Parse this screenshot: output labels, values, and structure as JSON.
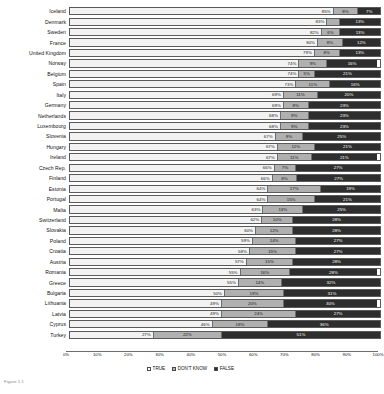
{
  "chart_data": {
    "type": "bar",
    "subtype": "horizontal-100-percent-stacked",
    "title": "",
    "xlabel": "",
    "ylabel": "",
    "xlim": [
      0,
      100
    ],
    "grid": false,
    "legend_position": "bottom-center",
    "legend": [
      "TRUE",
      "DON'T KNOW",
      "FALSE"
    ],
    "tick_labels": [
      "0%",
      "10%",
      "20%",
      "30%",
      "40%",
      "50%",
      "60%",
      "70%",
      "80%",
      "90%",
      "100%"
    ],
    "tick_values": [
      0,
      10,
      20,
      30,
      40,
      50,
      60,
      70,
      80,
      90,
      100
    ],
    "categories": [
      "Iceland",
      "Denmark",
      "Sweden",
      "France",
      "United Kingdom",
      "Norway",
      "Belgium",
      "Spain",
      "Italy",
      "Germany",
      "Netherlands",
      "Luxembourg",
      "Slovenia",
      "Hungary",
      "Ireland",
      "Czech Rep.",
      "Finland",
      "Estonia",
      "Portugal",
      "Malta",
      "Switzerland",
      "Slovakia",
      "Poland",
      "Croatia",
      "Austria",
      "Romania",
      "Greece",
      "Bulgaria",
      "Lithuania",
      "Latvia",
      "Cyprus",
      "Turkey"
    ],
    "series": [
      {
        "name": "TRUE",
        "color": "#f2f2f2",
        "values": [
          85,
          83,
          82,
          80,
          79,
          74,
          74,
          73,
          69,
          69,
          68,
          68,
          67,
          67,
          67,
          66,
          66,
          64,
          64,
          63,
          62,
          60,
          59,
          58,
          57,
          55,
          55,
          50,
          49,
          49,
          46,
          27
        ]
      },
      {
        "name": "DON'T KNOW",
        "color": "#b0b0b0",
        "values": [
          8,
          4,
          6,
          8,
          8,
          9,
          5,
          11,
          11,
          8,
          9,
          9,
          9,
          12,
          11,
          7,
          8,
          17,
          15,
          13,
          10,
          12,
          14,
          15,
          15,
          16,
          14,
          19,
          20,
          24,
          18,
          22
        ]
      },
      {
        "name": "FALSE",
        "color": "#2e2e2e",
        "values": [
          7,
          13,
          13,
          12,
          13,
          16,
          21,
          16,
          20,
          23,
          23,
          23,
          25,
          21,
          21,
          27,
          27,
          19,
          21,
          25,
          28,
          28,
          27,
          27,
          28,
          28,
          32,
          31,
          30,
          27,
          36,
          51
        ]
      }
    ],
    "rows": [
      {
        "category": "Iceland",
        "true": 85,
        "dont_know": 8,
        "false": 7,
        "true_label": "85%",
        "dont_know_label": "8%",
        "false_label": "7%"
      },
      {
        "category": "Denmark",
        "true": 83,
        "dont_know": 4,
        "false": 13,
        "true_label": "83%",
        "dont_know_label": "4%",
        "false_label": "13%"
      },
      {
        "category": "Sweden",
        "true": 82,
        "dont_know": 6,
        "false": 13,
        "true_label": "82%",
        "dont_know_label": "6%",
        "false_label": "13%"
      },
      {
        "category": "France",
        "true": 80,
        "dont_know": 8,
        "false": 12,
        "true_label": "80%",
        "dont_know_label": "8%",
        "false_label": "12%"
      },
      {
        "category": "United Kingdom",
        "true": 79,
        "dont_know": 8,
        "false": 13,
        "true_label": "79%",
        "dont_know_label": "8%",
        "false_label": "13%"
      },
      {
        "category": "Norway",
        "true": 74,
        "dont_know": 9,
        "false": 16,
        "true_label": "74%",
        "dont_know_label": "9%",
        "false_label": "16%"
      },
      {
        "category": "Belgium",
        "true": 74,
        "dont_know": 5,
        "false": 21,
        "true_label": "74%",
        "dont_know_label": "5%",
        "false_label": "21%"
      },
      {
        "category": "Spain",
        "true": 73,
        "dont_know": 11,
        "false": 16,
        "true_label": "73%",
        "dont_know_label": "11%",
        "false_label": "16%"
      },
      {
        "category": "Italy",
        "true": 69,
        "dont_know": 11,
        "false": 20,
        "true_label": "69%",
        "dont_know_label": "11%",
        "false_label": "20%"
      },
      {
        "category": "Germany",
        "true": 69,
        "dont_know": 8,
        "false": 23,
        "true_label": "69%",
        "dont_know_label": "8%",
        "false_label": "23%"
      },
      {
        "category": "Netherlands",
        "true": 68,
        "dont_know": 9,
        "false": 23,
        "true_label": "68%",
        "dont_know_label": "9%",
        "false_label": "23%"
      },
      {
        "category": "Luxembourg",
        "true": 68,
        "dont_know": 9,
        "false": 23,
        "true_label": "68%",
        "dont_know_label": "9%",
        "false_label": "23%"
      },
      {
        "category": "Slovenia",
        "true": 67,
        "dont_know": 9,
        "false": 25,
        "true_label": "67%",
        "dont_know_label": "9%",
        "false_label": "25%"
      },
      {
        "category": "Hungary",
        "true": 67,
        "dont_know": 12,
        "false": 21,
        "true_label": "67%",
        "dont_know_label": "12%",
        "false_label": "21%"
      },
      {
        "category": "Ireland",
        "true": 67,
        "dont_know": 11,
        "false": 21,
        "true_label": "67%",
        "dont_know_label": "11%",
        "false_label": "21%"
      },
      {
        "category": "Czech Rep.",
        "true": 66,
        "dont_know": 7,
        "false": 27,
        "true_label": "66%",
        "dont_know_label": "7%",
        "false_label": "27%"
      },
      {
        "category": "Finland",
        "true": 66,
        "dont_know": 8,
        "false": 27,
        "true_label": "66%",
        "dont_know_label": "8%",
        "false_label": "27%"
      },
      {
        "category": "Estonia",
        "true": 64,
        "dont_know": 17,
        "false": 19,
        "true_label": "64%",
        "dont_know_label": "17%",
        "false_label": "19%"
      },
      {
        "category": "Portugal",
        "true": 64,
        "dont_know": 15,
        "false": 21,
        "true_label": "64%",
        "dont_know_label": "15%",
        "false_label": "21%"
      },
      {
        "category": "Malta",
        "true": 63,
        "dont_know": 13,
        "false": 25,
        "true_label": "63%",
        "dont_know_label": "13%",
        "false_label": "25%"
      },
      {
        "category": "Switzerland",
        "true": 62,
        "dont_know": 10,
        "false": 28,
        "true_label": "62%",
        "dont_know_label": "10%",
        "false_label": "28%"
      },
      {
        "category": "Slovakia",
        "true": 60,
        "dont_know": 12,
        "false": 28,
        "true_label": "60%",
        "dont_know_label": "12%",
        "false_label": "28%"
      },
      {
        "category": "Poland",
        "true": 59,
        "dont_know": 14,
        "false": 27,
        "true_label": "59%",
        "dont_know_label": "14%",
        "false_label": "27%"
      },
      {
        "category": "Croatia",
        "true": 58,
        "dont_know": 15,
        "false": 27,
        "true_label": "58%",
        "dont_know_label": "15%",
        "false_label": "27%"
      },
      {
        "category": "Austria",
        "true": 57,
        "dont_know": 15,
        "false": 28,
        "true_label": "57%",
        "dont_know_label": "15%",
        "false_label": "28%"
      },
      {
        "category": "Romania",
        "true": 55,
        "dont_know": 16,
        "false": 28,
        "true_label": "55%",
        "dont_know_label": "16%",
        "false_label": "28%"
      },
      {
        "category": "Greece",
        "true": 55,
        "dont_know": 14,
        "false": 32,
        "true_label": "55%",
        "dont_know_label": "14%",
        "false_label": "32%"
      },
      {
        "category": "Bulgaria",
        "true": 50,
        "dont_know": 19,
        "false": 31,
        "true_label": "50%",
        "dont_know_label": "19%",
        "false_label": "31%"
      },
      {
        "category": "Lithuania",
        "true": 49,
        "dont_know": 20,
        "false": 30,
        "true_label": "49%",
        "dont_know_label": "20%",
        "false_label": "30%"
      },
      {
        "category": "Latvia",
        "true": 49,
        "dont_know": 24,
        "false": 27,
        "true_label": "49%",
        "dont_know_label": "24%",
        "false_label": "27%"
      },
      {
        "category": "Cyprus",
        "true": 46,
        "dont_know": 18,
        "false": 36,
        "true_label": "46%",
        "dont_know_label": "18%",
        "false_label": "36%"
      },
      {
        "category": "Turkey",
        "true": 27,
        "dont_know": 22,
        "false": 51,
        "true_label": "27%",
        "dont_know_label": "22%",
        "false_label": "51%"
      }
    ]
  },
  "caption": "Figure 1.1"
}
